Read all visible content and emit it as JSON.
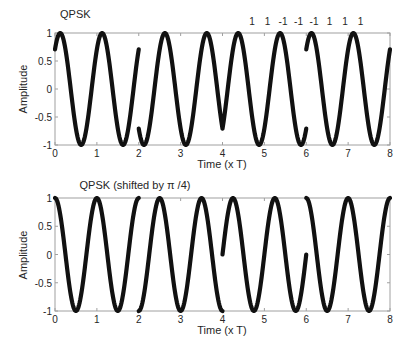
{
  "chart_data": [
    {
      "type": "line",
      "title": "QPSK",
      "xlabel": "Time (x T)",
      "ylabel": "Amplitude",
      "xlim": [
        0,
        8
      ],
      "ylim": [
        -1,
        1
      ],
      "xticks": [
        0,
        1,
        2,
        3,
        4,
        5,
        6,
        7,
        8
      ],
      "yticks": [
        -1,
        -0.5,
        0,
        0.5,
        1
      ],
      "yticklabels": [
        "-1",
        "-0.5",
        "0",
        "0.5",
        "1"
      ],
      "grid": false,
      "bit_annotations": [
        "1",
        "1",
        "-1",
        "-1",
        "-1",
        "1",
        "1",
        "1"
      ],
      "carrier_cycles_per_T": 1,
      "symbol_duration_T": 2,
      "segments": [
        {
          "t_start": 0,
          "t_end": 2,
          "phase_rad": -0.7854,
          "formula": "cos(2*pi*t - pi/4)"
        },
        {
          "t_start": 2,
          "t_end": 4,
          "phase_rad": 2.3562,
          "formula": "cos(2*pi*t + 3pi/4)"
        },
        {
          "t_start": 4,
          "t_end": 6,
          "phase_rad": -2.3562,
          "formula": "cos(2*pi*t - 3pi/4)"
        },
        {
          "t_start": 6,
          "t_end": 8,
          "phase_rad": -0.7854,
          "formula": "cos(2*pi*t - pi/4)"
        }
      ]
    },
    {
      "type": "line",
      "title": "QPSK (shifted by π /4)",
      "xlabel": "Time (x T)",
      "ylabel": "Amplitude",
      "xlim": [
        0,
        8
      ],
      "ylim": [
        -1,
        1
      ],
      "xticks": [
        0,
        1,
        2,
        3,
        4,
        5,
        6,
        7,
        8
      ],
      "yticks": [
        -1,
        -0.5,
        0,
        0.5,
        1
      ],
      "yticklabels": [
        "-1",
        "-0.5",
        "0",
        "0.5",
        "1"
      ],
      "grid": false,
      "carrier_cycles_per_T": 1,
      "symbol_duration_T": 2,
      "segments": [
        {
          "t_start": 0,
          "t_end": 2,
          "phase_rad": 0,
          "formula": "cos(2*pi*t)"
        },
        {
          "t_start": 2,
          "t_end": 4,
          "phase_rad": 3.1416,
          "formula": "cos(2*pi*t + pi)"
        },
        {
          "t_start": 4,
          "t_end": 6,
          "phase_rad": -1.5708,
          "formula": "cos(2*pi*t - pi/2)"
        },
        {
          "t_start": 6,
          "t_end": 8,
          "phase_rad": 0,
          "formula": "cos(2*pi*t)"
        }
      ]
    }
  ],
  "labels": {
    "top_title": "QPSK",
    "bottom_title": "QPSK (shifted by π /4)",
    "xlabel": "Time (x T)",
    "ylabel": "Amplitude"
  },
  "colors": {
    "line": "#111111",
    "frame": "#a0a0a0",
    "text": "#262626"
  }
}
